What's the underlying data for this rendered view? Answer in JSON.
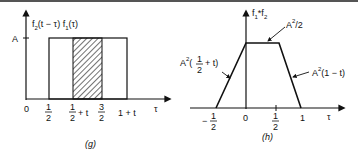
{
  "panels": [
    {
      "id": "g",
      "caption": "(g)",
      "y_axis_label": {
        "f": "f",
        "sub1": "2",
        "mid": "(t − τ) f",
        "sub2": "1",
        "end": "(τ)"
      },
      "y_tick": "A",
      "x_axis_label": "τ",
      "x_ticks": [
        {
          "num": "0"
        },
        {
          "num": "1",
          "den": "2"
        },
        {
          "num": "1",
          "den": "2",
          "suffix": "+ t"
        },
        {
          "num": "3",
          "den": "2"
        },
        {
          "text": "1 + t"
        }
      ],
      "description": "Rectangle of height A from 1/2 to 1+t overlapping; hatched overlap region from 1/2+t to 3/2"
    },
    {
      "id": "h",
      "caption": "(h)",
      "y_axis_label": {
        "f": "f",
        "sub1": "1",
        "mid": "*f",
        "sub2": "2"
      },
      "x_axis_label": "τ",
      "x_ticks": [
        {
          "text": "−",
          "num": "1",
          "den": "2"
        },
        {
          "num": "0"
        },
        {
          "num": "1",
          "den": "2"
        },
        {
          "num": "1"
        }
      ],
      "annotations": {
        "plateau": {
          "base": "A",
          "sup": "2",
          "rest": "/2"
        },
        "rising": {
          "base": "A",
          "sup": "2",
          "open": "(",
          "num": "1",
          "den": "2",
          "close": "+ t)"
        },
        "falling": {
          "base": "A",
          "sup": "2",
          "rest": "(1 − t)"
        }
      },
      "description": "Trapezoid convolution result: rises from −1/2 to 0, flat at A²/2 until ~t, falls to 0 at 1"
    }
  ]
}
